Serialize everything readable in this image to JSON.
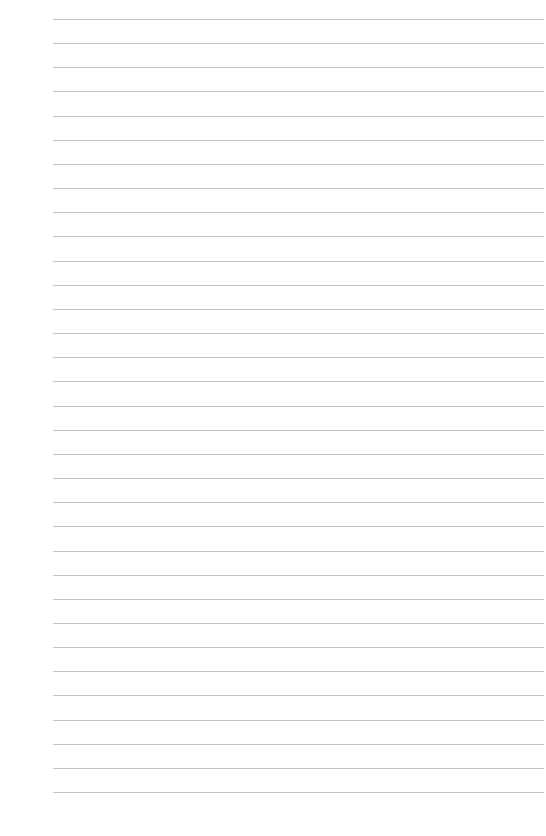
{
  "page": {
    "type": "lined-paper",
    "line_count": 33,
    "first_line_y": 19,
    "line_spacing": 24.16,
    "line_left": 53,
    "line_right": 544,
    "line_color": "#c4c4c4",
    "background": "#ffffff"
  }
}
